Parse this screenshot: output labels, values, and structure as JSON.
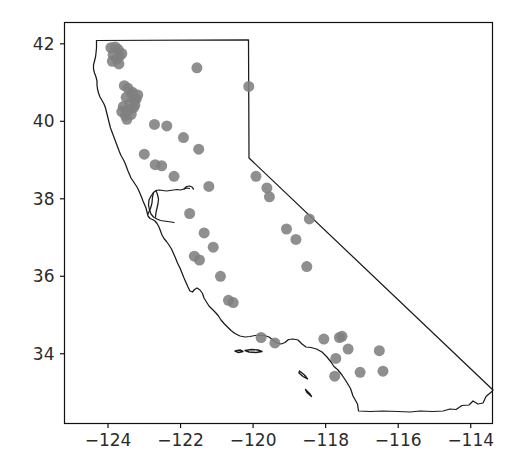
{
  "figure": {
    "background_color": "#ffffff",
    "axes_color": "#111111",
    "marker_color": "#808080",
    "outline_color": "#1a1a1a"
  },
  "chart_data": {
    "type": "scatter",
    "title": "",
    "xlabel": "",
    "ylabel": "",
    "xlim": [
      -125.2,
      -113.4
    ],
    "ylim": [
      32.2,
      42.55
    ],
    "xticks": [
      -124,
      -122,
      -120,
      -118,
      -116,
      -114
    ],
    "xtick_labels": [
      "−124",
      "−122",
      "−120",
      "−118",
      "−116",
      "−114"
    ],
    "yticks": [
      34,
      36,
      38,
      40,
      42
    ],
    "ytick_labels": [
      "34",
      "36",
      "38",
      "40",
      "42"
    ],
    "grid": false,
    "legend": null,
    "marker_color": "#808080",
    "marker_size": 11,
    "series": [
      {
        "name": "sites",
        "x": [
          -123.92,
          -123.8,
          -123.72,
          -123.86,
          -123.68,
          -123.76,
          -123.62,
          -123.88,
          -123.7,
          -123.55,
          -123.45,
          -123.35,
          -123.5,
          -123.28,
          -123.4,
          -123.58,
          -123.3,
          -123.22,
          -123.44,
          -123.36,
          -123.52,
          -123.26,
          -123.62,
          -123.18,
          -123.48,
          -123.33,
          -121.55,
          -120.12,
          -122.72,
          -122.38,
          -121.92,
          -121.5,
          -123.0,
          -122.7,
          -122.52,
          -122.18,
          -121.22,
          -119.92,
          -119.62,
          -119.55,
          -121.75,
          -121.35,
          -121.1,
          -121.62,
          -121.48,
          -120.9,
          -120.68,
          -120.55,
          -119.08,
          -118.45,
          -118.82,
          -118.52,
          -119.78,
          -119.4,
          -118.05,
          -117.62,
          -117.72,
          -117.38,
          -117.05,
          -116.52,
          -116.42,
          -117.75,
          -117.55
        ],
        "y": [
          41.9,
          41.92,
          41.85,
          41.72,
          41.68,
          41.6,
          41.75,
          41.55,
          41.48,
          40.92,
          40.85,
          40.72,
          40.62,
          40.55,
          40.45,
          40.38,
          40.35,
          40.58,
          40.28,
          40.18,
          40.15,
          40.42,
          40.25,
          40.68,
          40.05,
          40.75,
          41.38,
          40.9,
          39.92,
          39.88,
          39.58,
          39.28,
          39.15,
          38.88,
          38.85,
          38.58,
          38.32,
          38.58,
          38.28,
          38.05,
          37.62,
          37.12,
          36.75,
          36.52,
          36.42,
          36.0,
          35.38,
          35.32,
          37.22,
          37.48,
          36.95,
          36.25,
          34.42,
          34.28,
          34.38,
          34.42,
          33.88,
          34.12,
          33.52,
          34.08,
          33.55,
          33.42,
          34.45
        ]
      }
    ]
  },
  "geography": {
    "name": "california-state-boundary",
    "features": [
      "state-outline",
      "san-francisco-bay",
      "channel-islands"
    ]
  }
}
